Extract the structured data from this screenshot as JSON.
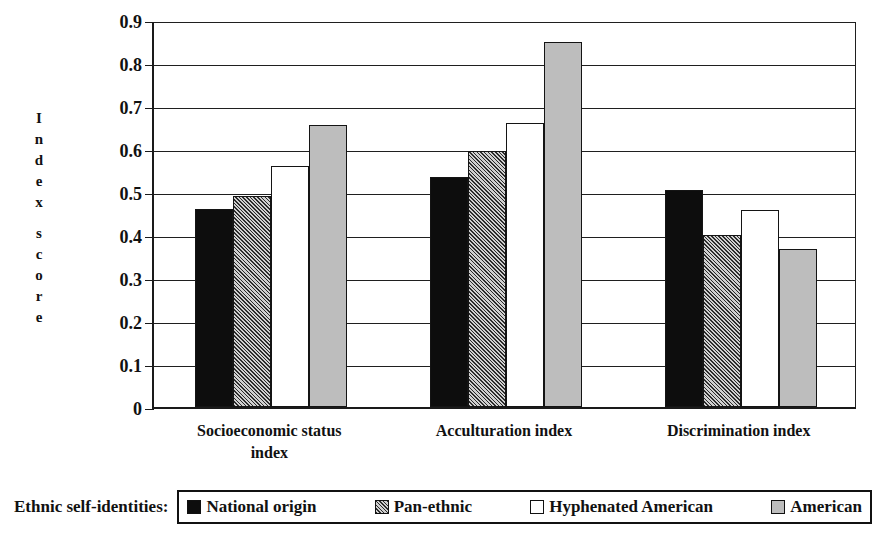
{
  "chart_data": {
    "type": "bar",
    "title": "",
    "subtitle": "",
    "xlabel": "",
    "ylabel": "Index score",
    "ylim": [
      0,
      0.9
    ],
    "yticks": [
      "0",
      "0.1",
      "0.2",
      "0.3",
      "0.4",
      "0.5",
      "0.6",
      "0.7",
      "0.8",
      "0.9"
    ],
    "ytick_values": [
      0,
      0.1,
      0.2,
      0.3,
      0.4,
      0.5,
      0.6,
      0.7,
      0.8,
      0.9
    ],
    "grid": true,
    "legend_position": "bottom",
    "legend_title": "Ethnic self-identities:",
    "categories": [
      "Socioeconomic status index",
      "Acculturation index",
      "Discrimination index"
    ],
    "series": [
      {
        "name": "National origin",
        "swatch": "solid-black",
        "color": "#0d0d0d",
        "values": [
          0.46,
          0.535,
          0.505
        ]
      },
      {
        "name": "Pan-ethnic",
        "swatch": "hatched-gray",
        "color": "#8c8c8c",
        "values": [
          0.49,
          0.595,
          0.4
        ]
      },
      {
        "name": "Hyphenated American",
        "swatch": "white",
        "color": "#ffffff",
        "values": [
          0.56,
          0.66,
          0.458
        ]
      },
      {
        "name": "American",
        "swatch": "light-gray",
        "color": "#bdbdbd",
        "values": [
          0.655,
          0.848,
          0.367
        ]
      }
    ]
  },
  "axis": {
    "ylabel_letters": [
      "I",
      "n",
      "d",
      "e",
      "x",
      "",
      "s",
      "c",
      "o",
      "r",
      "e"
    ]
  },
  "category_labels": [
    "Socioeconomic status index",
    "Acculturation index",
    "Discrimination index"
  ],
  "legend": {
    "title": "Ethnic self-identities:",
    "items": [
      {
        "label": "National origin"
      },
      {
        "label": "Pan-ethnic"
      },
      {
        "label": "Hyphenated American"
      },
      {
        "label": "American"
      }
    ]
  },
  "caption": ""
}
